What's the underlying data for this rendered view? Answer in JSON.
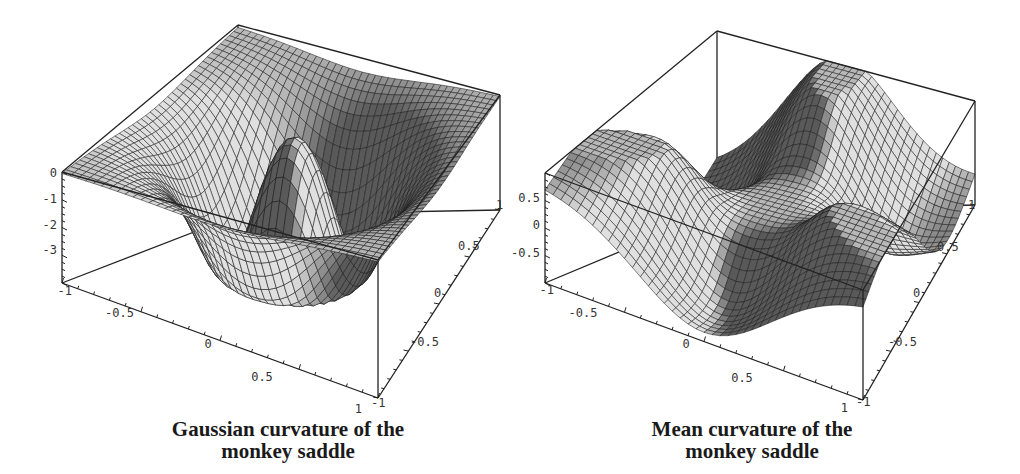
{
  "chart_data": [
    {
      "type": "surface3d",
      "title": "Gaussian curvature of the monkey saddle",
      "title_lines": [
        "Gaussian curvature of the",
        "monkey saddle"
      ],
      "function": "K(x,y) = -36 (x^2+y^2) / (1 + 9 (x^2+y^2)^2)^2",
      "x_range": [
        -1,
        1
      ],
      "y_range": [
        -1,
        1
      ],
      "z_range": [
        -4,
        0
      ],
      "x_ticks": [
        "-0.5",
        "0",
        "0.5",
        "1"
      ],
      "y_ticks": [
        "-1",
        "-0.5",
        "0",
        "0.5",
        "1"
      ],
      "z_ticks": [
        "0",
        "-1",
        "-2",
        "-3"
      ],
      "corner_labels": [
        "-1",
        "1",
        "-1",
        "1"
      ],
      "mesh_resolution": 40,
      "surface_color": "#b8b8b8",
      "mesh_color": "#1e1e1e"
    },
    {
      "type": "surface3d",
      "title": "Mean curvature of the monkey saddle",
      "title_lines": [
        "Mean curvature of the",
        "monkey saddle"
      ],
      "function": "H(x,y) ~ monkey saddle mean curvature (three-fold symmetric)",
      "x_range": [
        -1,
        1
      ],
      "y_range": [
        -1,
        1
      ],
      "z_range": [
        -1,
        0.75
      ],
      "x_ticks": [
        "-0.5",
        "0",
        "0.5",
        "1"
      ],
      "y_ticks": [
        "-1",
        "-0.5",
        "0",
        "0.5",
        "1"
      ],
      "z_ticks": [
        "0.5",
        "0",
        "-0.5",
        "-1"
      ],
      "corner_labels": [
        "-1",
        "1",
        "-1"
      ],
      "mesh_resolution": 40,
      "surface_color": "#b8b8b8",
      "mesh_color": "#1e1e1e"
    }
  ],
  "captions": {
    "left": {
      "line1": "Gaussian curvature of the",
      "line2": "monkey saddle"
    },
    "right": {
      "line1": "Mean curvature of the",
      "line2": "monkey saddle"
    }
  }
}
